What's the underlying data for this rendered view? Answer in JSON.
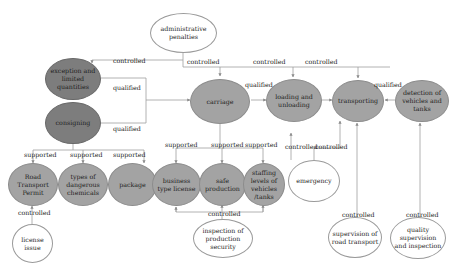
{
  "nodes": {
    "administrative_penalties": "administrative penalties",
    "exception_limited": "exception and limited quantities",
    "consigning": "consigning",
    "carriage": "carriage",
    "loading_unloading": "loading and unloading",
    "transporting": "transporting",
    "detection": "detection of vehicles and tanks",
    "road_transport_permit": "Road Transport Permit",
    "types_chemicals": "types of dangerous chemicals",
    "package": "package",
    "business_license": "business type license",
    "safe_production": "safe production",
    "staffing_levels": "staffing levels of vehicles /tanks",
    "emergency": "emergency",
    "license_issue": "license issue",
    "inspection_security": "inspection of production security",
    "supervision_road": "supervision of road transport",
    "quality_supervision": "quality supervision and inspection"
  },
  "edge_labels": {
    "ctrl_exception": "controlled",
    "ctrl_carriage": "controlled",
    "ctrl_loading": "controlled",
    "ctrl_transporting": "controlled",
    "qual_exception": "qualified",
    "qual_consigning": "qualified",
    "qual_carriage": "qualified",
    "qual_detection": "qualified",
    "sup_permit": "supported",
    "sup_types": "supported",
    "sup_package": "supported",
    "sup_business": "supported",
    "sup_safe": "supported",
    "sup_staffing": "supported",
    "ctrl_license": "controlled",
    "ctrl_inspection": "controlled",
    "ctrl_emergency_load": "controlled",
    "ctrl_emergency_trans": "controlled",
    "ctrl_supervision": "controlled",
    "ctrl_quality": "controlled"
  },
  "colors": {
    "dark_node": "#7d7d7d",
    "mid_node": "#a3a3a3",
    "light_node": "#ffffff",
    "line": "#9a9a9a"
  }
}
